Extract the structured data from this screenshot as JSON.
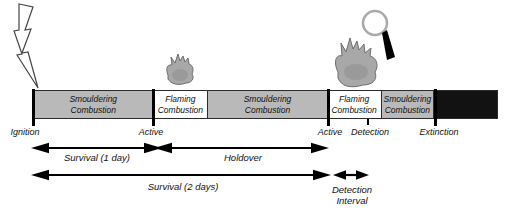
{
  "colors": {
    "bg": "#ffffff",
    "segment-gray": "#b9b9b9",
    "segment-white": "#ffffff",
    "segment-black": "#121212",
    "outline": "#2b2b2b",
    "text": "#111111",
    "fire-gray": "#a8a8a8",
    "fire-outline": "#6e6e6e",
    "magnifier-ring": "#a9a9a9",
    "arrow": "#000000"
  },
  "icons": {
    "ignition": "lightning-icon",
    "flaming_small": "fire-icon",
    "flaming_large": "fire-icon",
    "detection": "magnifying-glass-icon"
  },
  "timeline": {
    "segments": [
      {
        "line1": "Smouldering",
        "line2": "Combustion",
        "style": "gray"
      },
      {
        "line1": "Flaming",
        "line2": "Combustion",
        "style": "white"
      },
      {
        "line1": "Smouldering",
        "line2": "Combustion",
        "style": "gray"
      },
      {
        "line1": "Flaming",
        "line2": "Combustion",
        "style": "white"
      },
      {
        "line1": "Smouldering",
        "line2": "Combustion",
        "style": "gray"
      },
      {
        "line1": "",
        "line2": "",
        "style": "black"
      }
    ],
    "milestones": [
      {
        "label": "Ignition"
      },
      {
        "label": "Active"
      },
      {
        "label": "Active"
      },
      {
        "label": "Detection"
      },
      {
        "label": "Extinction"
      }
    ]
  },
  "intervals": [
    {
      "label": "Survival (1 day)"
    },
    {
      "label": "Holdover"
    },
    {
      "label": "Survival (2 days)"
    },
    {
      "line1": "Detection",
      "line2": "Interval"
    }
  ]
}
